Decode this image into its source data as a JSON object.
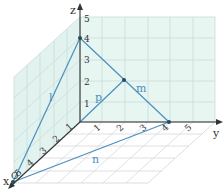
{
  "colors": {
    "wall_fill": "#e4f4f0",
    "grid": "#c8ddd8",
    "floor_grid": "#d4d4d4",
    "axis": "#333333",
    "line": "#4a8fc0",
    "label": "#4a8fc0",
    "point": "#2a4a5a"
  },
  "axes": {
    "x": {
      "label": "x",
      "ticks": [
        "1",
        "2",
        "3",
        "4",
        "5"
      ]
    },
    "y": {
      "label": "y",
      "ticks": [
        "1",
        "2",
        "3",
        "4",
        "5"
      ]
    },
    "z": {
      "label": "z",
      "ticks": [
        "1",
        "2",
        "3",
        "4",
        "5"
      ]
    },
    "origin_label": "O"
  },
  "lines": [
    {
      "name": "l",
      "label": "l"
    },
    {
      "name": "m",
      "label": "m"
    },
    {
      "name": "n",
      "label": "n"
    },
    {
      "name": "p",
      "label": "p"
    }
  ],
  "points": [
    {
      "name": "A",
      "coords": "(5,0,0)"
    },
    {
      "name": "B",
      "coords": "(0,4,0)"
    },
    {
      "name": "C",
      "coords": "(0,0,4)"
    },
    {
      "name": "M",
      "coords": "(0,2,2)"
    }
  ]
}
